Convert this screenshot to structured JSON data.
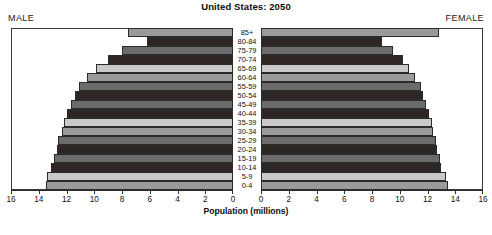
{
  "header": {
    "title": "United States: 2050",
    "male_label": "MALE",
    "female_label": "FEMALE"
  },
  "axis": {
    "title": "Population (millions)",
    "male_ticks": [
      "16",
      "14",
      "12",
      "10",
      "8",
      "6",
      "4",
      "2",
      "0"
    ],
    "female_ticks": [
      "0",
      "2",
      "4",
      "6",
      "8",
      "10",
      "12",
      "14",
      "16"
    ],
    "max": 16,
    "step": 2
  },
  "colors": {
    "shade_light": "#c9c9c9",
    "shade_medium": "#9a9a9a",
    "shade_dark": "#6b6b6b",
    "shade_darkest": "#2e2622",
    "frame": "#3a3a3a",
    "background": "#ffffff",
    "text": "#111111"
  },
  "chart_data": {
    "type": "bar",
    "subtype": "population-pyramid",
    "title": "United States: 2050",
    "xlabel": "Population (millions)",
    "ylabel": "",
    "xlim": [
      0,
      16
    ],
    "grid": false,
    "legend": "none",
    "orientation": "horizontal",
    "categories": [
      "85+",
      "80-84",
      "75-79",
      "70-74",
      "65-69",
      "60-64",
      "55-59",
      "50-54",
      "45-49",
      "40-44",
      "35-39",
      "30-34",
      "25-29",
      "20-24",
      "15-19",
      "10-14",
      "5-9",
      "0-4"
    ],
    "series": [
      {
        "name": "MALE",
        "side": "left",
        "values": [
          7.6,
          6.2,
          8.0,
          9.0,
          9.9,
          10.5,
          11.1,
          11.4,
          11.7,
          12.0,
          12.2,
          12.3,
          12.6,
          12.7,
          12.9,
          13.1,
          13.4,
          13.5
        ]
      },
      {
        "name": "FEMALE",
        "side": "right",
        "values": [
          12.8,
          8.7,
          9.5,
          10.2,
          10.7,
          11.1,
          11.5,
          11.7,
          11.9,
          12.1,
          12.3,
          12.4,
          12.6,
          12.7,
          12.9,
          13.0,
          13.3,
          13.5
        ]
      }
    ],
    "bar_shades": [
      "shade_medium",
      "shade_darkest",
      "shade_dark",
      "shade_darkest",
      "shade_light",
      "shade_medium",
      "shade_dark",
      "shade_darkest",
      "shade_dark",
      "shade_darkest",
      "shade_light",
      "shade_medium",
      "shade_dark",
      "shade_darkest",
      "shade_dark",
      "shade_darkest",
      "shade_light",
      "shade_medium"
    ]
  }
}
